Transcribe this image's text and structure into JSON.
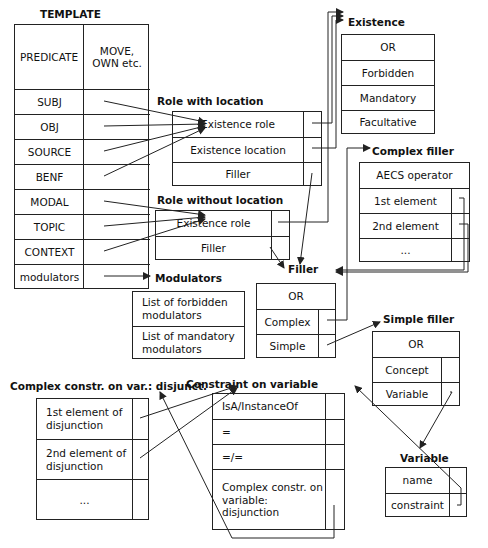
{
  "diagram": {
    "template": {
      "title": "TEMPLATE",
      "header_left": "PREDICATE",
      "header_right": "MOVE, OWN etc.",
      "rows": [
        "SUBJ",
        "OBJ",
        "SOURCE",
        "BENF",
        "MODAL",
        "TOPIC",
        "CONTEXT",
        "modulators"
      ]
    },
    "role_with_location": {
      "title": "Role with location",
      "rows": [
        "Existence role",
        "Existence location",
        "Filler"
      ]
    },
    "role_without_location": {
      "title": "Role without location",
      "rows": [
        "Existence role",
        "Filler"
      ]
    },
    "existence": {
      "title": "Existence",
      "rows": [
        "OR",
        "Forbidden",
        "Mandatory",
        "Facultative"
      ]
    },
    "complex_filler": {
      "title": "Complex filler",
      "rows": [
        "AECS operator",
        "1st element",
        "2nd element",
        "..."
      ]
    },
    "modulators": {
      "title": "Modulators",
      "rows": [
        "List of forbidden modulators",
        "List of mandatory modulators"
      ]
    },
    "filler": {
      "title": "Filler",
      "rows": [
        "OR",
        "Complex",
        "Simple"
      ]
    },
    "simple_filler": {
      "title": "Simple filler",
      "rows": [
        "OR",
        "Concept",
        "Variable"
      ]
    },
    "complex_constr": {
      "title": "Complex constr. on var.: disjunct.",
      "rows": [
        "1st element of disjunction",
        "2nd element of disjunction",
        "..."
      ]
    },
    "constraint_on_variable": {
      "title": "Constraint on variable",
      "rows": [
        "IsA/InstanceOf",
        "=",
        "=/=",
        "Complex constr. on variable: disjunction"
      ]
    },
    "variable": {
      "title": "Variable",
      "rows": [
        "name",
        "constraint"
      ]
    },
    "colors": {
      "line": "#222222",
      "background": "#ffffff"
    }
  }
}
